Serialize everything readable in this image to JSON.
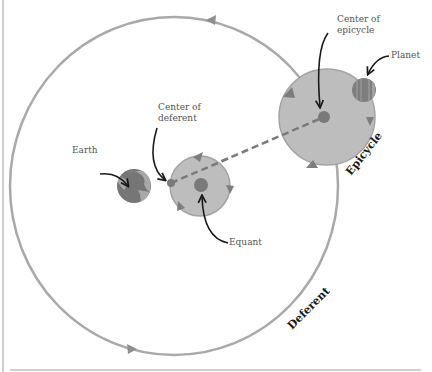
{
  "colors": {
    "orbit_stroke": "#a9a9a9",
    "fill_light": "#bdbdbd",
    "fill_dark": "#7a7a7a",
    "earth_ocean": "#767676",
    "earth_land": "#a8a8a8",
    "arrow_ink": "#1a1a1a",
    "label_text": "#555555",
    "border": "#a0a0a0"
  },
  "labels": {
    "earth": "Earth",
    "center_of_deferent_line1": "Center of",
    "center_of_deferent_line2": "deferent",
    "equant": "Equant",
    "center_of_epicycle_line1": "Center of",
    "center_of_epicycle_line2": "epicycle",
    "planet": "Planet",
    "epicycle": "Epicycle",
    "deferent": "Deferent"
  },
  "geometry": {
    "deferent": {
      "cx": 174,
      "cy": 186,
      "rx": 164,
      "ry": 169
    },
    "equant_circle": {
      "cx": 200,
      "cy": 186,
      "r": 30
    },
    "equant_dot": {
      "cx": 201,
      "cy": 185,
      "r": 7
    },
    "center_of_deferent_dot": {
      "cx": 171,
      "cy": 183,
      "r": 4
    },
    "earth": {
      "cx": 134,
      "cy": 186,
      "r": 17
    },
    "epicycle": {
      "cx": 327,
      "cy": 117,
      "r": 48
    },
    "epicycle_center_dot": {
      "cx": 324,
      "cy": 117,
      "r": 6
    },
    "planet": {
      "cx": 364,
      "cy": 90,
      "r": 12
    }
  }
}
